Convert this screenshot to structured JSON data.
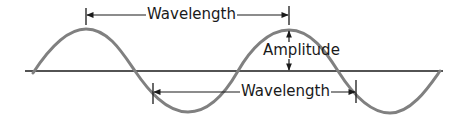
{
  "diagram": {
    "title": "",
    "labels": {
      "wavelength_top": "Wavelength",
      "wavelength_bottom": "Wavelength",
      "amplitude": "Amplitude"
    },
    "colors": {
      "wave": "#808080",
      "lines": "#1a1a1a",
      "background": "#ffffff"
    },
    "wave": {
      "type": "sine",
      "cycles": 2,
      "crests": 2,
      "troughs": 2
    }
  }
}
